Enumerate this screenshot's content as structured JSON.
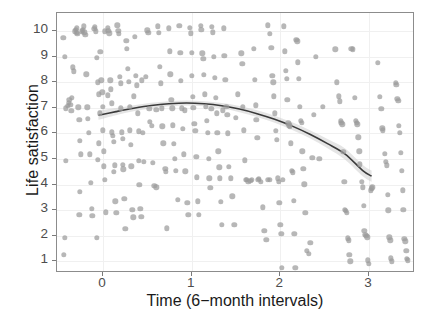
{
  "chart_data": {
    "type": "scatter",
    "title": "",
    "xlabel": "Time (6−month intervals)",
    "ylabel": "Life satisfaction",
    "xlim": [
      -0.52,
      3.52
    ],
    "ylim": [
      0.55,
      10.7
    ],
    "xticks": [
      0,
      1,
      2,
      3
    ],
    "xticklabels": [
      "0",
      "1",
      "2",
      "3"
    ],
    "yticks": [
      1,
      2,
      3,
      4,
      5,
      6,
      7,
      8,
      9,
      10
    ],
    "yticklabels": [
      "1",
      "2",
      "3",
      "4",
      "5",
      "6",
      "7",
      "8",
      "9",
      "10"
    ],
    "grid": true,
    "legend": null,
    "point_color": "#9b9b9b",
    "point_opacity": 0.72,
    "point_size_px": 5.4,
    "fit": {
      "name": "loess-quadratic-trend",
      "line_color": "#3a3a3a",
      "band_color": "#cfcfcf",
      "band_opacity": 0.55,
      "x": [
        -0.05,
        0.15,
        0.35,
        0.55,
        0.75,
        0.95,
        1.15,
        1.35,
        1.55,
        1.75,
        1.95,
        2.15,
        2.35,
        2.55,
        2.75,
        2.95,
        3.05
      ],
      "y": [
        6.68,
        6.82,
        6.95,
        7.06,
        7.13,
        7.16,
        7.13,
        7.05,
        6.92,
        6.74,
        6.52,
        6.25,
        5.93,
        5.56,
        5.15,
        4.5,
        4.28
      ],
      "ylower": [
        6.5,
        6.68,
        6.83,
        6.95,
        7.03,
        7.06,
        7.03,
        6.94,
        6.8,
        6.61,
        6.38,
        6.1,
        5.77,
        5.38,
        4.93,
        4.28,
        4.06
      ],
      "yupper": [
        6.86,
        6.96,
        7.07,
        7.17,
        7.23,
        7.26,
        7.23,
        7.16,
        7.04,
        6.87,
        6.66,
        6.4,
        6.09,
        5.74,
        5.37,
        4.72,
        4.5
      ]
    },
    "points": [
      [
        -0.45,
        9.72
      ],
      [
        -0.43,
        8.98
      ],
      [
        -0.42,
        6.98
      ],
      [
        -0.42,
        4.94
      ],
      [
        -0.43,
        1.92
      ],
      [
        -0.44,
        1.27
      ],
      [
        -0.38,
        7.3
      ],
      [
        -0.37,
        7.12
      ],
      [
        -0.36,
        6.88
      ],
      [
        -0.35,
        7.38
      ],
      [
        -0.34,
        8.58
      ],
      [
        -0.33,
        8.42
      ],
      [
        -0.32,
        9.98
      ],
      [
        -0.31,
        10.05
      ],
      [
        -0.3,
        9.92
      ],
      [
        -0.3,
        10.1
      ],
      [
        -0.29,
        9.88
      ],
      [
        -0.28,
        7.02
      ],
      [
        -0.27,
        6.52
      ],
      [
        -0.26,
        5.72
      ],
      [
        -0.25,
        5.18
      ],
      [
        -0.26,
        3.72
      ],
      [
        -0.27,
        2.82
      ],
      [
        -0.24,
        9.98
      ],
      [
        -0.23,
        10.02
      ],
      [
        -0.22,
        10.18
      ],
      [
        -0.21,
        9.95
      ],
      [
        -0.2,
        9.85
      ],
      [
        -0.19,
        8.3
      ],
      [
        -0.18,
        7.02
      ],
      [
        -0.17,
        6.58
      ],
      [
        -0.16,
        6.02
      ],
      [
        -0.15,
        5.18
      ],
      [
        -0.14,
        4.08
      ],
      [
        -0.13,
        3.05
      ],
      [
        -0.12,
        2.78
      ],
      [
        -0.1,
        10.08
      ],
      [
        -0.09,
        10.15
      ],
      [
        -0.08,
        9.98
      ],
      [
        -0.07,
        8.95
      ],
      [
        -0.06,
        8.0
      ],
      [
        -0.05,
        7.52
      ],
      [
        -0.04,
        6.78
      ],
      [
        -0.05,
        5.62
      ],
      [
        -0.06,
        4.98
      ],
      [
        -0.07,
        1.92
      ],
      [
        -0.03,
        9.18
      ],
      [
        -0.02,
        8.08
      ],
      [
        -0.01,
        7.6
      ],
      [
        0.0,
        7.05
      ],
      [
        0.0,
        6.12
      ],
      [
        0.01,
        5.3
      ],
      [
        0.01,
        4.72
      ],
      [
        0.02,
        4.2
      ],
      [
        0.03,
        2.92
      ],
      [
        0.02,
        9.98
      ],
      [
        0.05,
        10.12
      ],
      [
        0.06,
        10.0
      ],
      [
        0.07,
        9.9
      ],
      [
        0.08,
        8.08
      ],
      [
        0.09,
        7.72
      ],
      [
        0.1,
        7.18
      ],
      [
        0.1,
        6.05
      ],
      [
        0.11,
        5.9
      ],
      [
        0.12,
        5.68
      ],
      [
        0.13,
        4.75
      ],
      [
        0.12,
        4.5
      ],
      [
        0.14,
        3.35
      ],
      [
        0.15,
        2.9
      ],
      [
        0.16,
        10.22
      ],
      [
        0.17,
        10.0
      ],
      [
        0.18,
        9.88
      ],
      [
        0.19,
        8.22
      ],
      [
        0.2,
        7.95
      ],
      [
        0.2,
        6.98
      ],
      [
        0.21,
        6.05
      ],
      [
        0.22,
        5.78
      ],
      [
        0.22,
        4.78
      ],
      [
        0.23,
        4.6
      ],
      [
        0.24,
        3.45
      ],
      [
        0.25,
        2.28
      ],
      [
        0.26,
        9.62
      ],
      [
        0.27,
        9.3
      ],
      [
        0.28,
        8.52
      ],
      [
        0.29,
        8.02
      ],
      [
        0.3,
        7.05
      ],
      [
        0.3,
        6.12
      ],
      [
        0.31,
        5.55
      ],
      [
        0.32,
        4.72
      ],
      [
        0.33,
        3.02
      ],
      [
        0.34,
        2.72
      ],
      [
        0.36,
        9.78
      ],
      [
        0.37,
        8.25
      ],
      [
        0.38,
        7.88
      ],
      [
        0.39,
        6.78
      ],
      [
        0.4,
        6.08
      ],
      [
        0.4,
        4.92
      ],
      [
        0.41,
        4.0
      ],
      [
        0.42,
        3.05
      ],
      [
        0.43,
        2.75
      ],
      [
        0.45,
        6.02
      ],
      [
        0.46,
        4.88
      ],
      [
        0.5,
        10.02
      ],
      [
        0.51,
        9.92
      ],
      [
        0.52,
        6.95
      ],
      [
        0.53,
        6.45
      ],
      [
        0.55,
        6.3
      ],
      [
        0.56,
        4.85
      ],
      [
        0.58,
        3.95
      ],
      [
        0.6,
        3.9
      ],
      [
        0.62,
        10.18
      ],
      [
        0.63,
        9.92
      ],
      [
        0.64,
        8.6
      ],
      [
        0.65,
        7.95
      ],
      [
        0.66,
        6.98
      ],
      [
        0.67,
        6.28
      ],
      [
        0.68,
        5.62
      ],
      [
        0.7,
        4.62
      ],
      [
        0.71,
        4.5
      ],
      [
        0.72,
        2.3
      ],
      [
        0.74,
        10.1
      ],
      [
        0.75,
        9.2
      ],
      [
        0.76,
        8.3
      ],
      [
        0.77,
        7.3
      ],
      [
        0.78,
        6.98
      ],
      [
        0.79,
        6.32
      ],
      [
        0.8,
        5.6
      ],
      [
        0.81,
        5.0
      ],
      [
        0.82,
        4.55
      ],
      [
        0.84,
        3.4
      ],
      [
        0.86,
        10.2
      ],
      [
        0.87,
        9.15
      ],
      [
        0.88,
        8.05
      ],
      [
        0.89,
        6.98
      ],
      [
        0.9,
        6.18
      ],
      [
        0.91,
        5.18
      ],
      [
        0.93,
        4.52
      ],
      [
        0.95,
        3.3
      ],
      [
        0.96,
        2.82
      ],
      [
        0.98,
        10.12
      ],
      [
        0.99,
        9.9
      ],
      [
        1.0,
        9.15
      ],
      [
        1.0,
        8.25
      ],
      [
        1.01,
        7.42
      ],
      [
        1.02,
        7.0
      ],
      [
        1.03,
        6.38
      ],
      [
        1.04,
        6.1
      ],
      [
        1.05,
        5.08
      ],
      [
        1.06,
        4.28
      ],
      [
        1.07,
        3.35
      ],
      [
        1.08,
        2.82
      ],
      [
        1.1,
        10.2
      ],
      [
        1.11,
        10.05
      ],
      [
        1.12,
        9.12
      ],
      [
        1.13,
        8.92
      ],
      [
        1.14,
        8.28
      ],
      [
        1.15,
        7.52
      ],
      [
        1.16,
        7.05
      ],
      [
        1.17,
        6.5
      ],
      [
        1.18,
        6.02
      ],
      [
        1.19,
        5.02
      ],
      [
        1.2,
        4.25
      ],
      [
        1.21,
        3.88
      ],
      [
        1.23,
        10.15
      ],
      [
        1.24,
        9.95
      ],
      [
        1.25,
        9.0
      ],
      [
        1.26,
        8.18
      ],
      [
        1.27,
        7.38
      ],
      [
        1.28,
        6.78
      ],
      [
        1.29,
        6.02
      ],
      [
        1.3,
        5.3
      ],
      [
        1.31,
        4.68
      ],
      [
        1.32,
        4.25
      ],
      [
        1.33,
        3.32
      ],
      [
        1.34,
        2.42
      ],
      [
        1.36,
        10.1
      ],
      [
        1.37,
        9.02
      ],
      [
        1.38,
        8.1
      ],
      [
        1.39,
        7.05
      ],
      [
        1.4,
        6.72
      ],
      [
        1.41,
        6.0
      ],
      [
        1.42,
        4.7
      ],
      [
        1.44,
        4.25
      ],
      [
        1.46,
        3.55
      ],
      [
        1.48,
        2.42
      ],
      [
        1.56,
        9.12
      ],
      [
        1.57,
        8.72
      ],
      [
        1.58,
        7.05
      ],
      [
        1.59,
        6.12
      ],
      [
        1.6,
        4.95
      ],
      [
        1.61,
        4.2
      ],
      [
        1.62,
        4.18
      ],
      [
        1.64,
        4.12
      ],
      [
        1.66,
        4.15
      ],
      [
        1.68,
        4.18
      ],
      [
        1.7,
        9.3
      ],
      [
        1.71,
        8.1
      ],
      [
        1.72,
        7.1
      ],
      [
        1.73,
        6.52
      ],
      [
        1.74,
        5.82
      ],
      [
        1.75,
        4.18
      ],
      [
        1.76,
        4.22
      ],
      [
        1.78,
        4.12
      ],
      [
        1.8,
        3.12
      ],
      [
        1.82,
        2.2
      ],
      [
        1.84,
        1.85
      ],
      [
        1.86,
        10.22
      ],
      [
        1.88,
        9.88
      ],
      [
        1.9,
        9.35
      ],
      [
        1.91,
        8.25
      ],
      [
        1.92,
        8.0
      ],
      [
        1.93,
        7.45
      ],
      [
        1.94,
        6.78
      ],
      [
        1.95,
        6.1
      ],
      [
        1.96,
        5.75
      ],
      [
        1.97,
        4.25
      ],
      [
        1.98,
        4.12
      ],
      [
        1.99,
        3.3
      ],
      [
        2.0,
        2.42
      ],
      [
        2.01,
        2.08
      ],
      [
        2.02,
        0.75
      ],
      [
        2.04,
        10.18
      ],
      [
        2.05,
        9.2
      ],
      [
        2.06,
        8.45
      ],
      [
        2.07,
        8.12
      ],
      [
        2.08,
        7.3
      ],
      [
        2.09,
        6.4
      ],
      [
        2.1,
        6.32
      ],
      [
        2.11,
        6.28
      ],
      [
        2.12,
        5.62
      ],
      [
        2.13,
        4.55
      ],
      [
        2.14,
        4.48
      ],
      [
        2.15,
        3.38
      ],
      [
        2.16,
        2.08
      ],
      [
        2.17,
        0.75
      ],
      [
        2.18,
        9.65
      ],
      [
        2.19,
        9.6
      ],
      [
        2.2,
        8.78
      ],
      [
        2.21,
        8.12
      ],
      [
        2.22,
        7.05
      ],
      [
        2.23,
        6.48
      ],
      [
        2.24,
        6.42
      ],
      [
        2.25,
        5.3
      ],
      [
        2.26,
        4.62
      ],
      [
        2.27,
        4.02
      ],
      [
        2.28,
        2.9
      ],
      [
        2.3,
        1.42
      ],
      [
        2.32,
        1.3
      ],
      [
        2.34,
        1.72
      ],
      [
        2.36,
        5.05
      ],
      [
        2.38,
        6.72
      ],
      [
        2.62,
        9.28
      ],
      [
        2.64,
        8.0
      ],
      [
        2.66,
        7.45
      ],
      [
        2.67,
        7.25
      ],
      [
        2.68,
        6.5
      ],
      [
        2.69,
        6.42
      ],
      [
        2.7,
        6.35
      ],
      [
        2.71,
        5.28
      ],
      [
        2.72,
        4.12
      ],
      [
        2.73,
        3.02
      ],
      [
        2.74,
        2.98
      ],
      [
        2.75,
        2.9
      ],
      [
        2.76,
        1.9
      ],
      [
        2.77,
        1.82
      ],
      [
        2.78,
        1.25
      ],
      [
        2.79,
        1.0
      ],
      [
        2.8,
        9.3
      ],
      [
        2.82,
        9.28
      ],
      [
        2.84,
        7.4
      ],
      [
        2.85,
        6.5
      ],
      [
        2.86,
        6.42
      ],
      [
        2.87,
        6.35
      ],
      [
        2.88,
        5.85
      ],
      [
        2.89,
        5.3
      ],
      [
        2.9,
        4.8
      ],
      [
        2.92,
        4.1
      ],
      [
        2.93,
        3.9
      ],
      [
        2.94,
        3.18
      ],
      [
        2.95,
        2.2
      ],
      [
        2.96,
        2.05
      ],
      [
        2.97,
        2.0
      ],
      [
        2.98,
        1.95
      ],
      [
        2.99,
        1.05
      ],
      [
        3.0,
        0.9
      ],
      [
        3.02,
        3.78
      ],
      [
        3.03,
        3.85
      ],
      [
        3.04,
        3.9
      ],
      [
        3.1,
        8.75
      ],
      [
        3.12,
        7.42
      ],
      [
        3.14,
        6.95
      ],
      [
        3.15,
        6.2
      ],
      [
        3.16,
        6.12
      ],
      [
        3.18,
        5.2
      ],
      [
        3.19,
        4.9
      ],
      [
        3.2,
        4.75
      ],
      [
        3.21,
        3.6
      ],
      [
        3.22,
        3.0
      ],
      [
        3.23,
        1.95
      ],
      [
        3.24,
        1.82
      ],
      [
        3.25,
        1.12
      ],
      [
        3.26,
        1.0
      ],
      [
        3.3,
        7.98
      ],
      [
        3.31,
        7.9
      ],
      [
        3.32,
        7.35
      ],
      [
        3.33,
        7.28
      ],
      [
        3.34,
        6.3
      ],
      [
        3.35,
        6.02
      ],
      [
        3.36,
        5.25
      ],
      [
        3.37,
        4.55
      ],
      [
        3.38,
        3.78
      ],
      [
        3.39,
        3.02
      ],
      [
        3.4,
        1.88
      ],
      [
        3.41,
        1.78
      ],
      [
        3.42,
        1.42
      ],
      [
        3.43,
        1.1
      ],
      [
        3.44,
        1.05
      ],
      [
        -0.4,
        7.08
      ],
      [
        -0.39,
        7.2
      ],
      [
        0.44,
        8.08
      ],
      [
        0.48,
        8.22
      ],
      [
        1.5,
        6.6
      ],
      [
        1.52,
        7.52
      ],
      [
        2.4,
        9.0
      ],
      [
        2.44,
        5.02
      ],
      [
        2.48,
        7.05
      ],
      [
        1.86,
        4.2
      ],
      [
        1.88,
        4.18
      ],
      [
        2.03,
        4.2
      ],
      [
        0.6,
        6.92
      ],
      [
        0.92,
        6.9
      ],
      [
        1.22,
        6.95
      ],
      [
        1.35,
        6.9
      ],
      [
        0.05,
        7.48
      ],
      [
        0.35,
        7.45
      ]
    ]
  }
}
